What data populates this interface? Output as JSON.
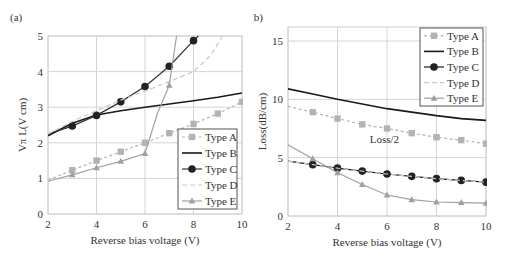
{
  "chart_data": [
    {
      "panel_label": "(a)",
      "type": "line",
      "title": "",
      "xlabel": "Reverse bias voltage (V)",
      "ylabel": "Vπ L(V cm)",
      "xlim": [
        2,
        10
      ],
      "ylim": [
        0,
        5
      ],
      "xticks": [
        2,
        4,
        6,
        8,
        10
      ],
      "yticks": [
        0,
        1,
        2,
        3,
        4,
        5
      ],
      "grid": true,
      "legend_position": "lower right",
      "series": [
        {
          "name": "Type A",
          "style": "dashed",
          "marker": "square",
          "color": "#b3b3b3",
          "x": [
            2,
            3,
            4,
            5,
            6,
            7,
            8,
            9,
            10
          ],
          "y": [
            0.95,
            1.23,
            1.5,
            1.75,
            2.0,
            2.27,
            2.53,
            2.82,
            3.15
          ],
          "marker_x": [
            3,
            4,
            5,
            6,
            7,
            8,
            9,
            10
          ]
        },
        {
          "name": "Type B",
          "style": "solid",
          "marker": "none",
          "color": "#1a1a1a",
          "x": [
            2,
            3,
            4,
            5,
            6,
            7,
            8,
            9,
            10
          ],
          "y": [
            2.2,
            2.55,
            2.78,
            2.9,
            3.0,
            3.09,
            3.18,
            3.28,
            3.4
          ]
        },
        {
          "name": "Type C",
          "style": "solid",
          "marker": "circle",
          "color": "#333333",
          "x": [
            2,
            3,
            4,
            5,
            6,
            7,
            8,
            8.2
          ],
          "y": [
            2.25,
            2.47,
            2.77,
            3.15,
            3.58,
            4.15,
            4.87,
            5.0
          ],
          "marker_x": [
            3,
            4,
            5,
            6,
            7,
            8
          ]
        },
        {
          "name": "Type D",
          "style": "dashed",
          "marker": "none",
          "color": "#c8c8c8",
          "x": [
            2,
            3,
            4,
            5,
            6,
            7,
            8,
            8.7,
            9.2
          ],
          "y": [
            2.25,
            2.6,
            2.9,
            3.2,
            3.45,
            3.72,
            4.0,
            4.45,
            5.0
          ]
        },
        {
          "name": "Type E",
          "style": "solid",
          "marker": "triangle",
          "color": "#a0a0a0",
          "x": [
            2,
            3,
            4,
            5,
            6,
            6.5,
            7,
            7.3
          ],
          "y": [
            0.92,
            1.1,
            1.3,
            1.48,
            1.7,
            2.8,
            3.62,
            5.0
          ],
          "marker_x": [
            3,
            4,
            5,
            6,
            7
          ]
        }
      ]
    },
    {
      "panel_label": "(b)",
      "type": "line",
      "title": "",
      "xlabel": "Reverse bias voltage (V)",
      "ylabel": "Loss(dB/cm)",
      "xlim": [
        2,
        10
      ],
      "ylim": [
        0,
        16.2
      ],
      "xticks": [
        2,
        4,
        6,
        8,
        10
      ],
      "yticks": [
        0,
        5,
        10,
        15
      ],
      "grid": true,
      "legend_position": "upper right",
      "annotations": [
        {
          "text": "Loss/2",
          "x": 5.3,
          "y": 6.3
        }
      ],
      "series": [
        {
          "name": "Type A",
          "style": "dashed",
          "marker": "square",
          "color": "#b3b3b3",
          "x": [
            2,
            3,
            4,
            5,
            6,
            7,
            8,
            9,
            10
          ],
          "y": [
            9.4,
            8.9,
            8.35,
            7.85,
            7.5,
            7.1,
            6.75,
            6.5,
            6.2
          ],
          "marker_x": [
            3,
            4,
            5,
            6,
            7,
            8,
            9,
            10
          ]
        },
        {
          "name": "Type B",
          "style": "solid",
          "marker": "none",
          "color": "#1a1a1a",
          "x": [
            2,
            3,
            4,
            5,
            6,
            7,
            8,
            9,
            10
          ],
          "y": [
            10.9,
            10.45,
            10.0,
            9.6,
            9.2,
            8.9,
            8.6,
            8.35,
            8.2
          ]
        },
        {
          "name": "Type C",
          "style": "solid",
          "marker": "circle",
          "color": "#1a1a1a",
          "x": [
            2,
            3,
            4,
            5,
            6,
            7,
            8,
            9,
            10
          ],
          "y": [
            4.7,
            4.4,
            4.1,
            3.85,
            3.6,
            3.4,
            3.2,
            3.05,
            2.9
          ],
          "marker_x": [
            3,
            4,
            5,
            6,
            7,
            8,
            9,
            10
          ]
        },
        {
          "name": "Type D",
          "style": "dashed",
          "marker": "none",
          "color": "#c8c8c8",
          "x": [
            2,
            3,
            4,
            5,
            6,
            7,
            8,
            9,
            10
          ],
          "y": [
            4.7,
            4.4,
            4.1,
            3.85,
            3.6,
            3.4,
            3.2,
            3.05,
            2.9
          ]
        },
        {
          "name": "Type E",
          "style": "solid",
          "marker": "triangle",
          "color": "#a0a0a0",
          "x": [
            2,
            3,
            4,
            5,
            6,
            7,
            8,
            9,
            10
          ],
          "y": [
            6.1,
            4.9,
            3.7,
            2.7,
            1.8,
            1.4,
            1.2,
            1.15,
            1.1
          ],
          "marker_x": [
            3,
            4,
            5,
            6,
            7,
            8,
            9,
            10
          ]
        }
      ]
    }
  ]
}
